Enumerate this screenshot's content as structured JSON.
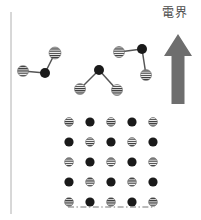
{
  "figure": {
    "title_text": "電界",
    "title_meaning": "electric field",
    "background_color": "#ffffff",
    "axis_line_color": "#b0b0b0",
    "dark_atom_color": "#1a1a1a",
    "hatched_atom_color": "#3a3a3a",
    "bond_color": "#555555",
    "arrow_color": "#6e6e6e",
    "dash_dot_line_color": "#777777"
  },
  "left_rule": {
    "x": 11,
    "y_top": 12,
    "y_bottom": 214,
    "width": 1
  },
  "field_arrow": {
    "name": "electric-field-arrow",
    "direction": "up",
    "shaft_x": 178,
    "shaft_width": 13,
    "tip_y": 34,
    "base_y": 104,
    "head_half_width": 14,
    "head_height": 22,
    "color": "#6e6e6e"
  },
  "label": {
    "text": "電界",
    "x": 162,
    "y": 7,
    "font_size": 12,
    "color": "#4a4a4a"
  },
  "molecules": [
    {
      "id": "molecule-1",
      "center": {
        "x": 45,
        "y": 73
      },
      "atoms": [
        {
          "type": "hatched",
          "x": 23,
          "y": 71,
          "r": 5.5
        },
        {
          "type": "hatched",
          "x": 55,
          "y": 53,
          "r": 6.0
        }
      ],
      "center_r": 5.0
    },
    {
      "id": "molecule-2",
      "center": {
        "x": 99,
        "y": 70
      },
      "atoms": [
        {
          "type": "hatched",
          "x": 80,
          "y": 89,
          "r": 5.5
        },
        {
          "type": "hatched",
          "x": 117,
          "y": 90,
          "r": 5.5
        }
      ],
      "center_r": 5.0
    },
    {
      "id": "molecule-3",
      "center": {
        "x": 142,
        "y": 49
      },
      "atoms": [
        {
          "type": "hatched",
          "x": 119,
          "y": 52,
          "r": 5.5
        },
        {
          "type": "hatched",
          "x": 146,
          "y": 75,
          "r": 5.5
        }
      ],
      "center_r": 5.0
    }
  ],
  "lattice": {
    "name": "crystal-lattice",
    "rows": 5,
    "cols": 5,
    "x_start": 69,
    "y_start": 122,
    "x_step": 21,
    "y_step": 20,
    "dark_radius": 4.6,
    "hatched_radius": 4.4,
    "pattern": [
      [
        "hatched",
        "dark",
        "hatched",
        "dark",
        "hatched"
      ],
      [
        "dark",
        "hatched",
        "dark",
        "hatched",
        "dark"
      ],
      [
        "hatched",
        "dark",
        "hatched",
        "dark",
        "hatched"
      ],
      [
        "dark",
        "hatched",
        "dark",
        "hatched",
        "dark"
      ],
      [
        "hatched",
        "dark",
        "hatched",
        "dark",
        "hatched"
      ]
    ]
  },
  "baseline": {
    "name": "surface-dash-dot-line",
    "x1": 68,
    "x2": 155,
    "y": 207,
    "style": "dash-dot",
    "color": "#777777"
  }
}
